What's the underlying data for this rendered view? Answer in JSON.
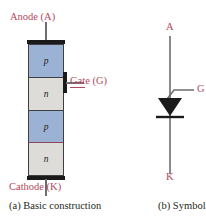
{
  "figure": {
    "background": "#ffffff",
    "label_color": "#b5485c",
    "text_color": "#231f20",
    "p_layer_color": "#9bb2d4",
    "n_layer_color": "#dedcd8",
    "electrode_color": "#1a1a1a",
    "wire_color": "#6e6e72"
  },
  "construction": {
    "caption": "(a) Basic construction",
    "anode_label": "Anode (A)",
    "cathode_label": "Cathode (K)",
    "gate_label": "Gate (G)",
    "layers": [
      {
        "name": "p-layer-top",
        "label": "p",
        "type": "p"
      },
      {
        "name": "n-layer-upper",
        "label": "n",
        "type": "n"
      },
      {
        "name": "p-layer-lower",
        "label": "p",
        "type": "p"
      },
      {
        "name": "n-layer-bottom",
        "label": "n",
        "type": "n"
      }
    ]
  },
  "symbol": {
    "caption": "(b) Symbol",
    "anode_label": "A",
    "cathode_label": "K",
    "gate_label": "G"
  }
}
